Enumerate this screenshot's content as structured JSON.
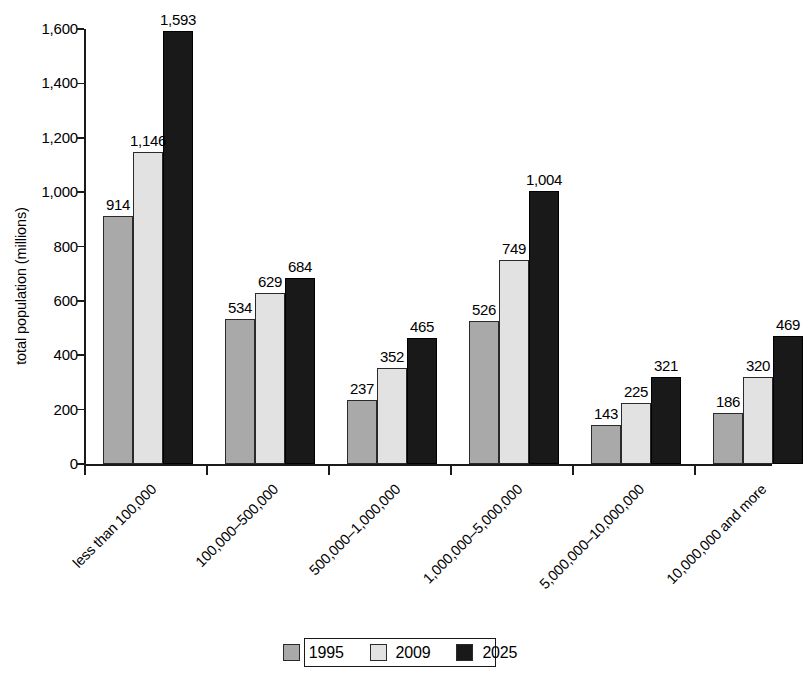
{
  "chart_data": {
    "type": "bar",
    "title": "",
    "subtitle": "",
    "xlabel": "",
    "ylabel": "total population (millions)",
    "ylim": [
      0,
      1600
    ],
    "ytick_labels": [
      "0",
      "200",
      "400",
      "600",
      "800",
      "1,000",
      "1,200",
      "1,400",
      "1,600"
    ],
    "ytick_values": [
      0,
      200,
      400,
      600,
      800,
      1000,
      1200,
      1400,
      1600
    ],
    "grid": false,
    "legend_position": "bottom",
    "categories": [
      "less than 100,000",
      "100,000–500,000",
      "500,000–1,000,000",
      "1,000,000–5,000,000",
      "5,000,000–10,000,000",
      "10,000,000 and more"
    ],
    "series": [
      {
        "name": "1995",
        "color": "#a9a9a9",
        "values": [
          914,
          534,
          237,
          526,
          143,
          186
        ],
        "labels": [
          "914",
          "534",
          "237",
          "526",
          "143",
          "186"
        ]
      },
      {
        "name": "2009",
        "color": "#e2e2e2",
        "values": [
          1146,
          629,
          352,
          749,
          225,
          320
        ],
        "labels": [
          "1,146",
          "629",
          "352",
          "749",
          "225",
          "320"
        ]
      },
      {
        "name": "2025",
        "color": "#191919",
        "values": [
          1593,
          684,
          465,
          1004,
          321,
          469
        ],
        "labels": [
          "1,593",
          "684",
          "465",
          "1,004",
          "321",
          "469"
        ]
      }
    ]
  },
  "legend": {
    "entries": [
      {
        "label": "1995",
        "color": "#a9a9a9"
      },
      {
        "label": "2009",
        "color": "#e2e2e2"
      },
      {
        "label": "2025",
        "color": "#191919"
      }
    ]
  }
}
